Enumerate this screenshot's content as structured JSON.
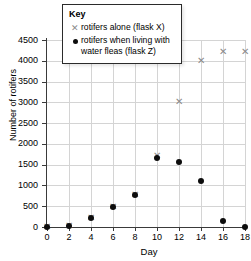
{
  "chart_data": {
    "type": "scatter",
    "title": "",
    "xlabel": "Day",
    "ylabel": "Number of rotifers",
    "xlim": [
      0,
      18
    ],
    "ylim": [
      0,
      4500
    ],
    "grid": true,
    "legend_position": "upper-left-inside",
    "legend_title": "Key",
    "x_ticks": [
      0,
      2,
      4,
      6,
      8,
      10,
      12,
      14,
      16,
      18
    ],
    "y_ticks": [
      0,
      500,
      1000,
      1500,
      2000,
      2500,
      3000,
      3500,
      4000,
      4500
    ],
    "x": [
      0,
      2,
      4,
      6,
      8,
      10,
      12,
      14,
      16,
      18
    ],
    "series": [
      {
        "name": "rotifers alone (flask X)",
        "marker": "x",
        "color": "#8a8a8a",
        "values": [
          0,
          20,
          220,
          470,
          760,
          1700,
          3000,
          4000,
          4200,
          4200
        ]
      },
      {
        "name": "rotifers when living with water fleas (flask Z)",
        "marker": "circle",
        "color": "#0d0d0d",
        "values": [
          0,
          20,
          220,
          470,
          760,
          1650,
          1570,
          1100,
          150,
          0
        ]
      }
    ]
  },
  "legend": {
    "title": "Key",
    "entries": [
      {
        "marker_icon": "cross-marker-icon",
        "label": "rotifers alone (flask X)"
      },
      {
        "marker_icon": "dot-marker-icon",
        "label": "rotifers when living with water fleas (flask Z)"
      }
    ]
  },
  "axes": {
    "x_title": "Day",
    "y_title": "Number of rotifers"
  }
}
